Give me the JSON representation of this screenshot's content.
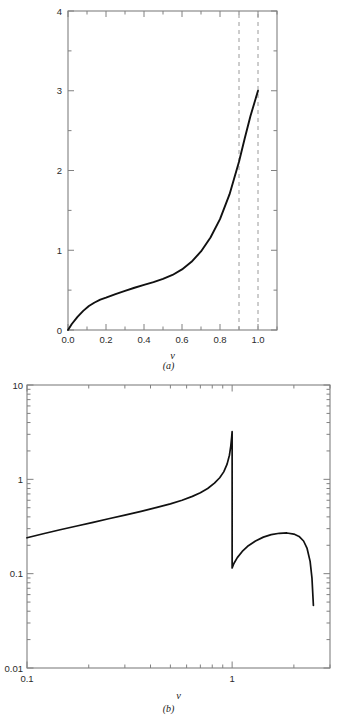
{
  "figure": {
    "panels": [
      {
        "id": "a",
        "caption": "(a)"
      },
      {
        "id": "b",
        "caption": "(b)"
      }
    ]
  },
  "panel_a": {
    "caption": "(a)",
    "xlabel": "v",
    "x_tick_labels": [
      "0.0",
      "0.2",
      "0.4",
      "0.6",
      "0.8",
      "1.0"
    ],
    "y_tick_labels": [
      "0",
      "1",
      "2",
      "3",
      "4"
    ]
  },
  "panel_b": {
    "caption": "(b)",
    "xlabel": "v",
    "x_tick_labels": [
      "0.1",
      "1"
    ],
    "y_tick_labels": [
      "0.01",
      "0.1",
      "1",
      "10"
    ]
  },
  "colors": {
    "curve": "#111111",
    "axis": "#808080",
    "dashed": "#9a9a9a",
    "background": "#ffffff",
    "text": "#1a1a1a"
  },
  "chart_data": [
    {
      "type": "line",
      "panel": "a",
      "title": "",
      "xlabel": "v",
      "ylabel": "",
      "xscale": "linear",
      "yscale": "linear",
      "xlim": [
        0.0,
        1.1
      ],
      "ylim": [
        0.0,
        4.0
      ],
      "grid": false,
      "legend": "none",
      "x_ticks_major": [
        0.0,
        0.2,
        0.4,
        0.6,
        0.8,
        1.0
      ],
      "x_ticks_minor": [
        0.1,
        0.3,
        0.5,
        0.7,
        0.9,
        1.1
      ],
      "x_tick_labels": [
        "0.0",
        "0.2",
        "0.4",
        "0.6",
        "0.8",
        "1.0"
      ],
      "y_ticks_major": [
        0,
        1,
        2,
        3,
        4
      ],
      "y_ticks_minor": [
        0.5,
        1.5,
        2.5,
        3.5
      ],
      "y_tick_labels": [
        "0",
        "1",
        "2",
        "3",
        "4"
      ],
      "series": [
        {
          "name": "curve",
          "x": [
            0.0,
            0.02,
            0.05,
            0.08,
            0.11,
            0.14,
            0.17,
            0.2,
            0.25,
            0.3,
            0.35,
            0.4,
            0.45,
            0.5,
            0.55,
            0.6,
            0.65,
            0.7,
            0.75,
            0.8,
            0.85,
            0.9,
            0.93,
            0.96,
            0.98,
            1.0
          ],
          "y": [
            0.0,
            0.075,
            0.165,
            0.24,
            0.3,
            0.345,
            0.38,
            0.405,
            0.45,
            0.49,
            0.53,
            0.565,
            0.6,
            0.64,
            0.69,
            0.76,
            0.855,
            0.985,
            1.16,
            1.39,
            1.7,
            2.11,
            2.4,
            2.68,
            2.84,
            3.0
          ]
        }
      ],
      "annotations": [
        {
          "type": "vline",
          "x": 0.9,
          "style": "dashed",
          "y_from": 0.0,
          "y_to": 4.0
        },
        {
          "type": "vline",
          "x": 1.0,
          "style": "dashed",
          "y_from": 0.0,
          "y_to": 4.0
        }
      ]
    },
    {
      "type": "line",
      "panel": "b",
      "title": "",
      "xlabel": "v",
      "ylabel": "",
      "xscale": "log",
      "yscale": "log",
      "xlim": [
        0.1,
        3.0
      ],
      "ylim": [
        0.01,
        10.0
      ],
      "grid": false,
      "legend": "none",
      "x_ticks_major": [
        0.1,
        1.0
      ],
      "x_tick_labels": [
        "0.1",
        "1"
      ],
      "y_ticks_major": [
        0.01,
        0.1,
        1.0,
        10.0
      ],
      "y_tick_labels": [
        "0.01",
        "0.1",
        "1",
        "10"
      ],
      "series": [
        {
          "name": "branch-1",
          "x": [
            0.1,
            0.12,
            0.145,
            0.175,
            0.21,
            0.25,
            0.3,
            0.36,
            0.43,
            0.5,
            0.57,
            0.64,
            0.7,
            0.76,
            0.82,
            0.87,
            0.91,
            0.945,
            0.97,
            0.985,
            0.995,
            1.0
          ],
          "y": [
            0.24,
            0.265,
            0.292,
            0.32,
            0.35,
            0.382,
            0.418,
            0.458,
            0.505,
            0.55,
            0.6,
            0.66,
            0.72,
            0.8,
            0.91,
            1.04,
            1.2,
            1.45,
            1.8,
            2.25,
            2.8,
            3.2
          ]
        },
        {
          "name": "branch-2",
          "x": [
            1.0,
            1.02,
            1.06,
            1.12,
            1.2,
            1.3,
            1.42,
            1.55,
            1.7,
            1.85,
            2.0,
            2.12,
            2.23,
            2.32,
            2.4,
            2.45,
            2.49
          ],
          "y": [
            0.115,
            0.128,
            0.148,
            0.172,
            0.198,
            0.222,
            0.244,
            0.259,
            0.268,
            0.27,
            0.263,
            0.248,
            0.222,
            0.185,
            0.135,
            0.09,
            0.046
          ]
        }
      ],
      "annotations": [
        {
          "type": "discontinuity",
          "x": 1.0,
          "y_from": 3.2,
          "y_to": 0.115
        }
      ]
    }
  ]
}
